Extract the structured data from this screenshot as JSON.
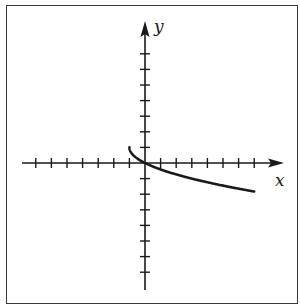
{
  "chart_data": {
    "type": "line",
    "title": "",
    "xlabel": "x",
    "ylabel": "y",
    "xlim": [
      -7,
      9
    ],
    "ylim": [
      -8,
      9
    ],
    "x_ticks": [
      -7,
      -6,
      -5,
      -4,
      -3,
      -2,
      -1,
      1,
      2,
      3,
      4,
      5,
      6,
      7
    ],
    "y_ticks": [
      -7,
      -6,
      -5,
      -4,
      -3,
      -2,
      -1,
      1,
      2,
      3,
      4,
      5,
      6,
      7
    ],
    "tick_labels_shown": false,
    "grid": false,
    "legend": null,
    "series": [
      {
        "name": "curve",
        "description": "Square-root shaped curve starting at (-1, 1) with vertical tangent, passing through origin, decreasing to the right",
        "equation_estimate": "y = 1 - sqrt(x + 1)",
        "x": [
          -1,
          -0.75,
          -0.5,
          0,
          1,
          2,
          3,
          4,
          5,
          6,
          7
        ],
        "y": [
          1,
          0.5,
          0.29,
          0,
          -0.41,
          -0.73,
          -1,
          -1.24,
          -1.45,
          -1.65,
          -1.83
        ]
      }
    ]
  },
  "labels": {
    "x_axis": "x",
    "y_axis": "y"
  },
  "colors": {
    "axis": "#1a1a1a",
    "curve": "#1a1a1a",
    "frame": "#3a3a3a",
    "background": "#ffffff"
  }
}
